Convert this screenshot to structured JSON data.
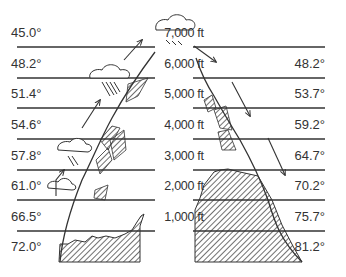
{
  "diagram": {
    "type": "orographic-lift-temperature-profile",
    "altitudes": [
      "7,000 ft",
      "6,000 ft",
      "5,000 ft",
      "4,000 ft",
      "3,000 ft",
      "2,000 ft",
      "1,000 ft"
    ],
    "windward_temperatures": [
      "45.0°",
      "48.2°",
      "51.4°",
      "54.6°",
      "57.8°",
      "61.0°",
      "66.5°",
      "72.0°"
    ],
    "leeward_temperatures": [
      "48.2°",
      "53.7°",
      "59.2°",
      "64.7°",
      "70.2°",
      "75.7°",
      "81.2°"
    ],
    "line_color": "#333333",
    "hatch_color": "#444444"
  }
}
